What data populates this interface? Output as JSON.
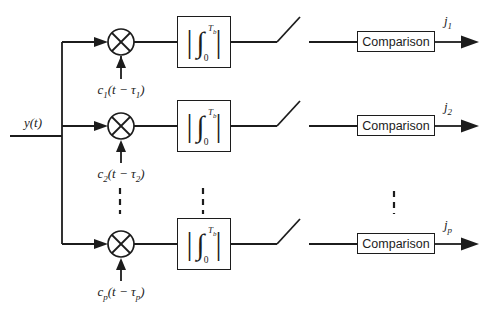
{
  "figure": {
    "type": "block-diagram",
    "colors": {
      "line": "#1c1c1c",
      "background": "#ffffff"
    },
    "input_label": "y(t)",
    "integrator": {
      "bar": "|",
      "integral": "∫",
      "upper_limit": "T",
      "upper_limit_sub": "b",
      "lower_limit": "0"
    },
    "branches": [
      {
        "carrier_base": "c",
        "carrier_sub": "1",
        "carrier_mid": "(t − τ",
        "carrier_tau_sub": "1",
        "carrier_close": ")",
        "comparison_label": "Comparison",
        "output_base": "j",
        "output_sub": "1"
      },
      {
        "carrier_base": "c",
        "carrier_sub": "2",
        "carrier_mid": "(t − τ",
        "carrier_tau_sub": "2",
        "carrier_close": ")",
        "comparison_label": "Comparison",
        "output_base": "j",
        "output_sub": "2"
      },
      {
        "carrier_base": "c",
        "carrier_sub": "p",
        "carrier_mid": "(t − τ",
        "carrier_tau_sub": "p",
        "carrier_close": ")",
        "comparison_label": "Comparison",
        "output_base": "j",
        "output_sub": "p"
      }
    ]
  }
}
